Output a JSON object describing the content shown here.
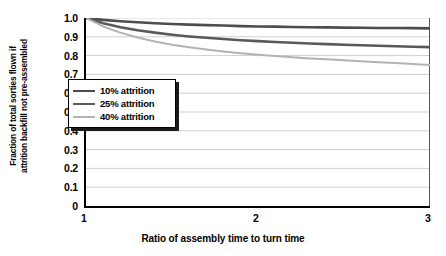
{
  "chart_data": {
    "type": "line",
    "title": "",
    "xlabel": "Ratio of assembly time to turn time",
    "ylabel_lines": [
      "Fraction of total sorties flown if",
      "attrition backfill not pre-assembled"
    ],
    "ylabel": "Fraction of total sorties flown if attrition backfill not pre-assembled",
    "xlim": [
      1,
      3
    ],
    "ylim": [
      0,
      1.0
    ],
    "grid": "horizontal",
    "legend_position": "upper-left-inside",
    "xticks": [
      "1",
      "2",
      "3"
    ],
    "xtick_values": [
      1,
      2,
      3
    ],
    "yticks": [
      "0",
      "0.1",
      "0.2",
      "0.3",
      "0.4",
      "0.5",
      "0.6",
      "0.7",
      "0.8",
      "0.9",
      "1.0"
    ],
    "ytick_values": [
      0,
      0.1,
      0.2,
      0.3,
      0.4,
      0.5,
      0.6,
      0.7,
      0.8,
      0.9,
      1.0
    ],
    "x": [
      1.0,
      1.1,
      1.2,
      1.3,
      1.4,
      1.5,
      1.6,
      1.7,
      1.8,
      1.9,
      2.0,
      2.1,
      2.2,
      2.3,
      2.4,
      2.5,
      2.6,
      2.7,
      2.8,
      2.9,
      3.0
    ],
    "series": [
      {
        "name": "10% attrition",
        "color": "#4d4d4d",
        "values": [
          1.0,
          0.99,
          0.983,
          0.977,
          0.972,
          0.968,
          0.965,
          0.962,
          0.96,
          0.957,
          0.955,
          0.954,
          0.952,
          0.951,
          0.95,
          0.949,
          0.948,
          0.947,
          0.947,
          0.946,
          0.945
        ]
      },
      {
        "name": "25% attrition",
        "color": "#595959",
        "values": [
          1.0,
          0.972,
          0.951,
          0.935,
          0.922,
          0.911,
          0.902,
          0.895,
          0.888,
          0.882,
          0.877,
          0.872,
          0.868,
          0.864,
          0.861,
          0.858,
          0.855,
          0.852,
          0.85,
          0.847,
          0.845
        ]
      },
      {
        "name": "40% attrition",
        "color": "#b3b3b3",
        "values": [
          1.0,
          0.955,
          0.922,
          0.896,
          0.875,
          0.858,
          0.844,
          0.832,
          0.822,
          0.813,
          0.805,
          0.798,
          0.791,
          0.785,
          0.78,
          0.775,
          0.77,
          0.765,
          0.76,
          0.755,
          0.75
        ]
      }
    ],
    "legend": [
      {
        "label": "10% attrition",
        "color": "#4d4d4d",
        "width": 2.6
      },
      {
        "label": "25% attrition",
        "color": "#595959",
        "width": 2.6
      },
      {
        "label": "40% attrition",
        "color": "#b3b3b3",
        "width": 2.0
      }
    ],
    "colors": {
      "axis": "#000000",
      "gridline": "#cfcfcf",
      "background": "#ffffff",
      "legend_border": "#000000",
      "legend_shadow": "#1a1a1a"
    }
  }
}
